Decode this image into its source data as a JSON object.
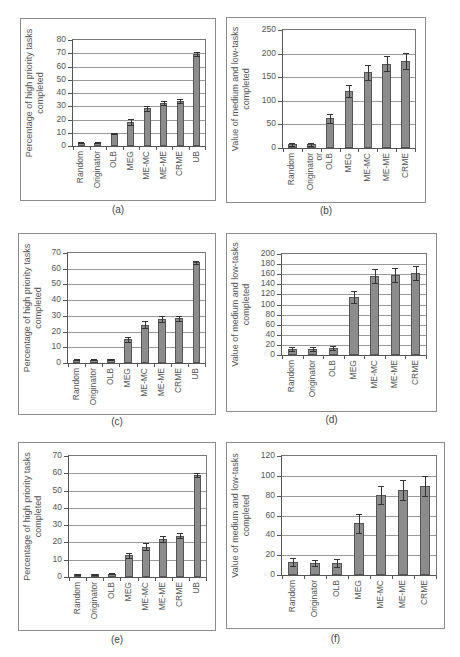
{
  "chart_data": [
    {
      "id": "a",
      "type": "bar",
      "panel_label": "(a)",
      "ylabel": "Percentage of high priority tasks\ncompleted",
      "categories": [
        "Random",
        "Originator",
        "OLB",
        "MEG",
        "ME-MC",
        "ME-ME",
        "CRME",
        "UB"
      ],
      "values": [
        2.5,
        2.5,
        9.5,
        18,
        28.5,
        32.5,
        34,
        69.5
      ],
      "error": [
        0.5,
        0.5,
        0.3,
        2.5,
        2,
        1.5,
        1.5,
        1.5
      ],
      "ylim": [
        0,
        80
      ],
      "yticks": [
        0,
        10,
        20,
        30,
        40,
        50,
        60,
        70,
        80
      ],
      "grid": true,
      "frame": {
        "x": 20,
        "y": 18,
        "w": 196,
        "h": 183
      },
      "plot": {
        "x": 72,
        "y": 39,
        "w": 134,
        "h": 108
      },
      "label_y": 204
    },
    {
      "id": "b",
      "type": "bar",
      "panel_label": "(b)",
      "ylabel": "Value of medium and low-tasks\ncompleted",
      "categories": [
        "Random",
        "Originator\nor",
        "OLB",
        "MEG",
        "ME-MC",
        "ME-ME",
        "CRME"
      ],
      "values": [
        8,
        8,
        63,
        120,
        160,
        179,
        185
      ],
      "error": [
        3,
        3,
        9,
        13,
        16,
        16,
        17
      ],
      "ylim": [
        0,
        250
      ],
      "yticks": [
        0,
        50,
        100,
        150,
        200,
        250
      ],
      "grid": true,
      "frame": {
        "x": 226,
        "y": 17,
        "w": 200,
        "h": 186
      },
      "plot": {
        "x": 282,
        "y": 29,
        "w": 134,
        "h": 120
      },
      "label_y": 205
    },
    {
      "id": "c",
      "type": "bar",
      "panel_label": "(c)",
      "ylabel": "Percentage of high priority tasks\ncompleted",
      "categories": [
        "Random",
        "Originator",
        "OLB",
        "MEG",
        "ME-MC",
        "ME-ME",
        "CRME",
        "UB"
      ],
      "values": [
        2,
        2,
        2.5,
        15,
        24.5,
        28,
        28.5,
        64
      ],
      "error": [
        0.3,
        0.3,
        0.3,
        1.5,
        2,
        2,
        1.5,
        1.2
      ],
      "ylim": [
        0,
        70
      ],
      "yticks": [
        0,
        10,
        20,
        30,
        40,
        50,
        60,
        70
      ],
      "grid": true,
      "frame": {
        "x": 18,
        "y": 233,
        "w": 198,
        "h": 182
      },
      "plot": {
        "x": 67,
        "y": 252,
        "w": 139,
        "h": 112
      },
      "label_y": 416
    },
    {
      "id": "d",
      "type": "bar",
      "panel_label": "(d)",
      "ylabel": "Value of medium and low-tasks\ncompleted",
      "categories": [
        "Random",
        "Originator",
        "OLB",
        "MEG",
        "ME-MC",
        "ME-ME",
        "CRME"
      ],
      "values": [
        12,
        12,
        13,
        115,
        157,
        159,
        162
      ],
      "error": [
        4,
        4,
        4,
        12,
        14,
        14,
        14
      ],
      "ylim": [
        0,
        200
      ],
      "yticks": [
        0,
        20,
        40,
        60,
        80,
        100,
        120,
        140,
        160,
        180,
        200
      ],
      "grid": true,
      "frame": {
        "x": 226,
        "y": 233,
        "w": 211,
        "h": 179
      },
      "plot": {
        "x": 281,
        "y": 253,
        "w": 146,
        "h": 103
      },
      "label_y": 414
    },
    {
      "id": "e",
      "type": "bar",
      "panel_label": "(e)",
      "ylabel": "Percentage of high priority tasks\ncompleted",
      "categories": [
        "Random",
        "Originator",
        "OLB",
        "MEG",
        "ME-MC",
        "ME-ME",
        "CRME",
        "UB"
      ],
      "values": [
        1.5,
        1.5,
        1.8,
        12.5,
        17.5,
        22,
        24,
        59
      ],
      "error": [
        0.2,
        0.2,
        0.3,
        1.5,
        2,
        1.5,
        1.2,
        1
      ],
      "ylim": [
        0,
        70
      ],
      "yticks": [
        0,
        10,
        20,
        30,
        40,
        50,
        60,
        70
      ],
      "grid": true,
      "frame": {
        "x": 18,
        "y": 442,
        "w": 198,
        "h": 189
      },
      "plot": {
        "x": 68,
        "y": 455,
        "w": 139,
        "h": 123
      },
      "label_y": 634
    },
    {
      "id": "f",
      "type": "bar",
      "panel_label": "(f)",
      "ylabel": "Value of medium and low-tasks\ncompleted",
      "categories": [
        "Random",
        "Originator",
        "OLB",
        "MEG",
        "ME-MC",
        "ME-ME",
        "CRME"
      ],
      "values": [
        13,
        12,
        12,
        52,
        81,
        86,
        90
      ],
      "error": [
        4,
        3,
        4,
        10,
        9,
        10,
        10
      ],
      "ylim": [
        0,
        120
      ],
      "yticks": [
        0,
        20,
        40,
        60,
        80,
        100,
        120
      ],
      "grid": true,
      "frame": {
        "x": 226,
        "y": 442,
        "w": 219,
        "h": 187
      },
      "plot": {
        "x": 281,
        "y": 455,
        "w": 156,
        "h": 121
      },
      "label_y": 633
    }
  ]
}
